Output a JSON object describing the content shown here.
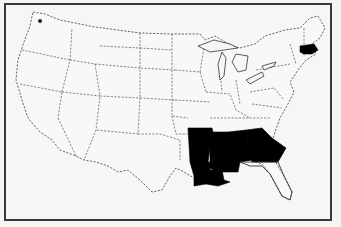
{
  "map": {
    "type": "choropleth",
    "region": "Contiguous United States",
    "highlight_color": "#000000",
    "base_color": "#f8f8f6",
    "highlighted_states": [
      "Arkansas",
      "Louisiana",
      "Mississippi",
      "Alabama",
      "Georgia",
      "Massachusetts"
    ]
  }
}
